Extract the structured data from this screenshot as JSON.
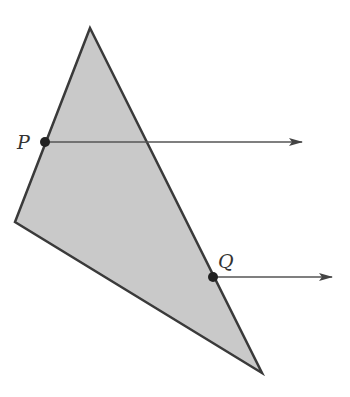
{
  "diagram": {
    "colors": {
      "fill": "#c9c9c9",
      "stroke": "#3a3a3a",
      "ray": "#555555",
      "point": "#222222"
    },
    "triangle": {
      "vertices": [
        [
          90,
          28
        ],
        [
          15,
          222
        ],
        [
          262,
          373
        ]
      ]
    },
    "points": [
      {
        "label": "P",
        "x": 45,
        "y": 142,
        "label_x": 17,
        "label_y": 149,
        "ray_end_x": 302
      },
      {
        "label": "Q",
        "x": 213,
        "y": 277,
        "label_x": 218,
        "label_y": 268,
        "ray_end_x": 332
      }
    ]
  }
}
